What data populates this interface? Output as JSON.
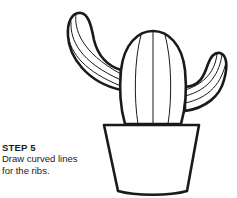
{
  "instruction": {
    "step_label": "STEP 5",
    "description_lines": [
      "Draw curved lines",
      "for the ribs."
    ]
  },
  "illustration": {
    "subject": "cactus-in-pot",
    "stroke_color": "#1a1a1a",
    "fill_color": "#ffffff"
  }
}
